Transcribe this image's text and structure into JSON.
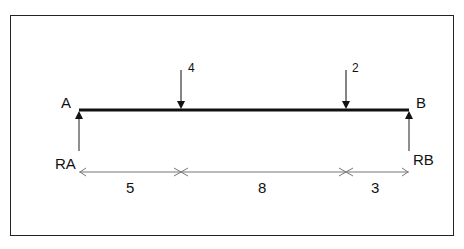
{
  "diagram": {
    "type": "simply-supported-beam",
    "supports": [
      {
        "point": "A",
        "reaction": "RA"
      },
      {
        "point": "B",
        "reaction": "RB"
      }
    ],
    "loads": [
      {
        "magnitude": "4",
        "position_from_A": 5
      },
      {
        "magnitude": "2",
        "position_from_A": 13
      }
    ],
    "dimensions": [
      "5",
      "8",
      "3"
    ]
  },
  "labels": {
    "point_a": "A",
    "point_b": "B",
    "reaction_a": "RA",
    "reaction_b": "RB",
    "load_1": "4",
    "load_2": "2",
    "dim_1": "5",
    "dim_2": "8",
    "dim_3": "3"
  }
}
